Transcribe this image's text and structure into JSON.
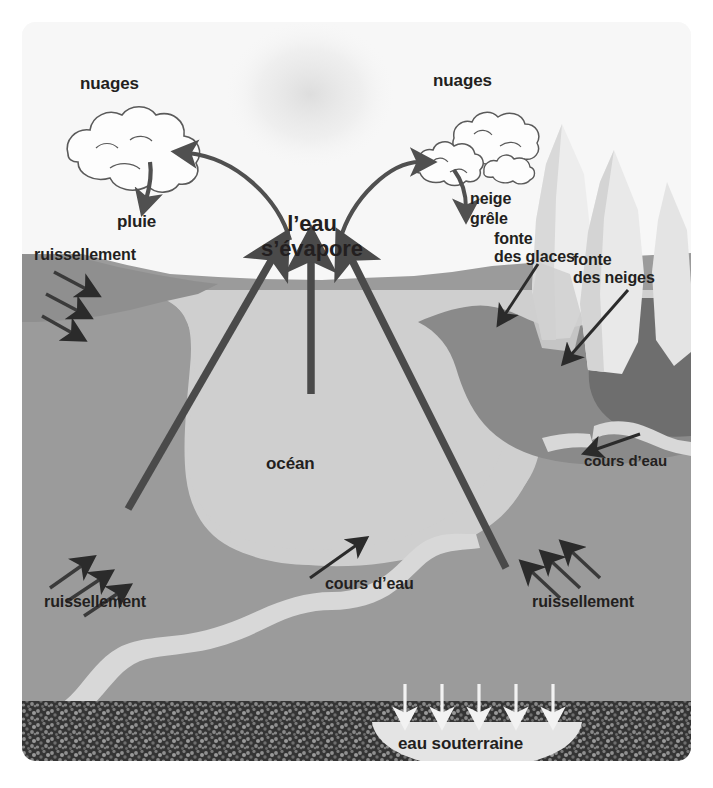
{
  "figure": {
    "ghost_header": "Comprendre le phénomène",
    "language": "fr"
  },
  "labels": {
    "nuages_left": "nuages",
    "nuages_right": "nuages",
    "pluie": "pluie",
    "eau_sevapore": "l’eau\ns’évapore",
    "neige": "neige",
    "grele": "grêle",
    "fonte_des_glaces": "fonte\ndes glaces",
    "fonte_des_neiges": "fonte\ndes neiges",
    "ruissellement_top_left": "ruissellement",
    "ruissellement_bottom_left": "ruissellement",
    "ruissellement_bottom_right": "ruissellement",
    "ocean": "océan",
    "cours_deau_middle": "cours d’eau",
    "cours_deau_right": "cours d’eau",
    "eau_souterraine": "eau souterraine"
  },
  "colors": {
    "sky": "#f7f7f7",
    "ocean": "#cfcfcf",
    "land": "#9b9b9b",
    "land_dark": "#8a8a8a",
    "land_darkest": "#6e6e6e",
    "river": "#d8d8d8",
    "mountain_light": "#ededed",
    "mountain_mid": "#dcdcdc",
    "mountain_shadow": "#c9c9c9",
    "bedrock": "#3a3a3a",
    "bedrock_speckle": "#8d8d8d",
    "groundwater": "#e4e4e4",
    "arrow_dark": "#4a4a4a",
    "arrow_thin": "#2b2b2b",
    "arrow_white": "#f2f2f2",
    "text": "#231f20",
    "cloud_fill": "#fdfdfd",
    "cloud_stroke": "#555555"
  },
  "elements": {
    "clouds_left_count": 1,
    "clouds_right_count": 3,
    "evaporation_arrows": 3,
    "runoff_arrows_top_left": 3,
    "runoff_arrows_bottom_left": 3,
    "runoff_arrows_bottom_right": 3,
    "infiltration_arrows": 5,
    "mountain_peaks": 3
  }
}
